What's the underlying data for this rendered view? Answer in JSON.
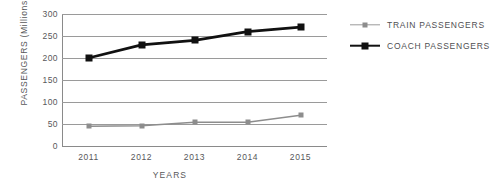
{
  "chart_data": {
    "type": "line",
    "title": "",
    "xlabel": "YEARS",
    "ylabel": "PASSENGERS (Millions)",
    "categories": [
      "2011",
      "2012",
      "2013",
      "2014",
      "2015"
    ],
    "ylim": [
      0,
      300
    ],
    "yticks": [
      "0",
      "50",
      "100",
      "150",
      "200",
      "250",
      "300"
    ],
    "ytick_values": [
      0,
      50,
      100,
      150,
      200,
      250,
      300
    ],
    "grid": "horizontal",
    "legend_position": "right",
    "series": [
      {
        "name": "TRAIN PASSENGERS",
        "color": "#8d8d8d",
        "marker": "square",
        "values": [
          45,
          46,
          54,
          54,
          70
        ]
      },
      {
        "name": "COACH PASSENGERS",
        "color": "#111111",
        "marker": "square",
        "values": [
          200,
          230,
          240,
          260,
          270
        ]
      }
    ]
  },
  "legend": {
    "items": [
      {
        "label": "TRAIN PASSENGERS"
      },
      {
        "label": "COACH PASSENGERS"
      }
    ]
  },
  "colors": {
    "train": "#8d8d8d",
    "coach": "#111111",
    "grid": "#9a9a9a",
    "text": "#58585a",
    "background": "#ffffff"
  }
}
